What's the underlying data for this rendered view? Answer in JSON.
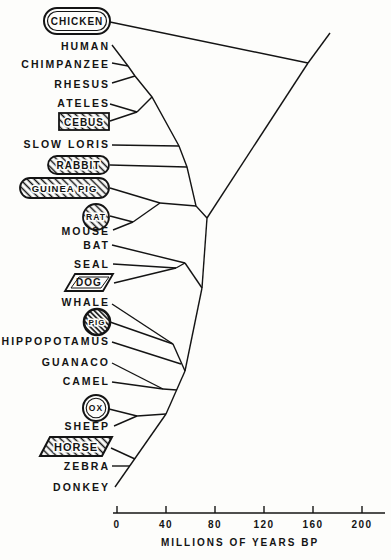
{
  "figure": {
    "kind": "phylogenetic tree (slanted cladogram), leaves at left, root at upper right",
    "ink_color": "#141414",
    "background_color": "#fdfdfb"
  },
  "taxa": [
    {
      "name": "CHICKEN",
      "shape": "double-outline-stadium"
    },
    {
      "name": "HUMAN",
      "shape": "none"
    },
    {
      "name": "CHIMPANZEE",
      "shape": "none"
    },
    {
      "name": "RHESUS",
      "shape": "none"
    },
    {
      "name": "ATELES",
      "shape": "none"
    },
    {
      "name": "CEBUS",
      "shape": "hatched-box"
    },
    {
      "name": "SLOW LORIS",
      "shape": "none"
    },
    {
      "name": "RABBIT",
      "shape": "hatched-stadium"
    },
    {
      "name": "GUINEA PIG",
      "shape": "hatched-stadium"
    },
    {
      "name": "RAT",
      "shape": "hatched-circle"
    },
    {
      "name": "MOUSE",
      "shape": "none"
    },
    {
      "name": "BAT",
      "shape": "none"
    },
    {
      "name": "SEAL",
      "shape": "none"
    },
    {
      "name": "DOG",
      "shape": "double-outline-parallelogram"
    },
    {
      "name": "WHALE",
      "shape": "none"
    },
    {
      "name": "PIG",
      "shape": "hatched-circle-thick-ring"
    },
    {
      "name": "HIPPOPOTAMUS",
      "shape": "none"
    },
    {
      "name": "GUANACO",
      "shape": "none"
    },
    {
      "name": "CAMEL",
      "shape": "none"
    },
    {
      "name": "OX",
      "shape": "double-outline-circle"
    },
    {
      "name": "SHEEP",
      "shape": "none"
    },
    {
      "name": "HORSE",
      "shape": "hatched-parallelogram"
    },
    {
      "name": "ZEBRA",
      "shape": "none"
    },
    {
      "name": "DONKEY",
      "shape": "none"
    }
  ],
  "axis": {
    "title": "MILLIONS OF YEARS BP",
    "ticks": [
      "0",
      "40",
      "80",
      "120",
      "160",
      "200"
    ],
    "range": [
      0,
      200
    ]
  },
  "tree": {
    "type": "cladogram",
    "outgroup": "CHICKEN",
    "groups": [
      {
        "clade": "primates",
        "members": [
          "HUMAN",
          "CHIMPANZEE",
          "RHESUS",
          "ATELES",
          "CEBUS",
          "SLOW LORIS"
        ]
      },
      {
        "clade": "glires",
        "members": [
          "RABBIT",
          "GUINEA PIG",
          "RAT",
          "MOUSE"
        ]
      },
      {
        "clade": "bat-carnivores",
        "members": [
          "BAT",
          "SEAL",
          "DOG"
        ]
      },
      {
        "clade": "cetartiodactyls",
        "members": [
          "WHALE",
          "PIG",
          "HIPPOPOTAMUS",
          "GUANACO",
          "CAMEL",
          "OX",
          "SHEEP"
        ]
      },
      {
        "clade": "perissodactyls",
        "members": [
          "HORSE",
          "ZEBRA",
          "DONKEY"
        ]
      }
    ]
  }
}
